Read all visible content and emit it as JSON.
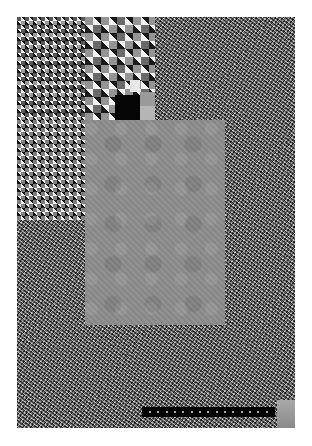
{
  "image": {
    "description": "Abstract noise / checkerboard test pattern with nested rectangles",
    "background_color": "#ffffff",
    "regions": [
      {
        "name": "noise-field",
        "type": "fine-noise",
        "tone": "#777777"
      },
      {
        "name": "checker-medium",
        "type": "checkerboard",
        "cell_px": 4
      },
      {
        "name": "checker-coarse",
        "type": "checkerboard",
        "cell_px": 8
      },
      {
        "name": "gray-square",
        "type": "flat-gray",
        "tone": "#8c8c8c"
      },
      {
        "name": "caption-bar",
        "type": "black-strip",
        "tone": "#050505"
      },
      {
        "name": "corner-patch",
        "type": "gray-gradient",
        "tone": "#a0a0a0"
      }
    ]
  },
  "caption": {
    "dots": 15
  }
}
